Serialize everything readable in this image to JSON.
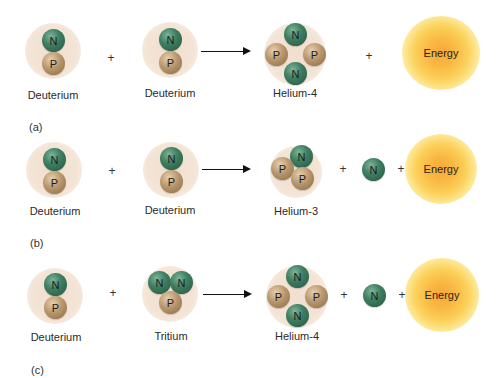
{
  "figure": {
    "colors": {
      "neutron": "#3f7f62",
      "proton": "#b8976d",
      "halo": "#f3e4d6",
      "energy": "#f9b843",
      "arrow": "#111111"
    },
    "particle_symbols": {
      "neutron": "N",
      "proton": "P"
    },
    "energy_label": "Energy",
    "plus": "+",
    "panels": [
      {
        "tag": "(a)",
        "reactants": [
          {
            "name": "Deuterium",
            "composition": [
              "N",
              "P"
            ]
          },
          {
            "name": "Deuterium",
            "composition": [
              "N",
              "P"
            ]
          }
        ],
        "products": [
          {
            "name": "Helium-4",
            "composition": [
              "N",
              "P",
              "P",
              "N"
            ]
          },
          {
            "name": "Energy"
          }
        ]
      },
      {
        "tag": "(b)",
        "reactants": [
          {
            "name": "Deuterium",
            "composition": [
              "N",
              "P"
            ]
          },
          {
            "name": "Deuterium",
            "composition": [
              "N",
              "P"
            ]
          }
        ],
        "products": [
          {
            "name": "Helium-3",
            "composition": [
              "N",
              "P",
              "P"
            ]
          },
          {
            "name": "Neutron",
            "composition": [
              "N"
            ]
          },
          {
            "name": "Energy"
          }
        ]
      },
      {
        "tag": "(c)",
        "reactants": [
          {
            "name": "Deuterium",
            "composition": [
              "N",
              "P"
            ]
          },
          {
            "name": "Tritium",
            "composition": [
              "N",
              "N",
              "P"
            ]
          }
        ],
        "products": [
          {
            "name": "Helium-4",
            "composition": [
              "N",
              "P",
              "P",
              "N"
            ]
          },
          {
            "name": "Neutron",
            "composition": [
              "N"
            ]
          },
          {
            "name": "Energy"
          }
        ]
      }
    ]
  }
}
